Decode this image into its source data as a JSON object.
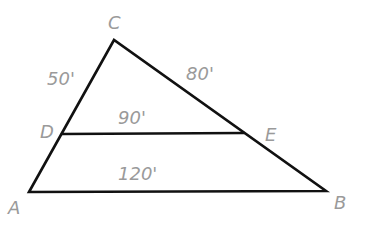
{
  "diagram": {
    "type": "triangle-with-parallel-segment",
    "points": {
      "A": {
        "label": "A",
        "x": 29,
        "y": 192
      },
      "B": {
        "label": "B",
        "x": 326,
        "y": 191
      },
      "C": {
        "label": "C",
        "x": 114,
        "y": 40
      },
      "D": {
        "label": "D",
        "x": 62,
        "y": 134
      },
      "E": {
        "label": "E",
        "x": 244,
        "y": 133
      }
    },
    "segments": [
      {
        "from": "A",
        "to": "C"
      },
      {
        "from": "C",
        "to": "B"
      },
      {
        "from": "A",
        "to": "B"
      },
      {
        "from": "D",
        "to": "E"
      }
    ],
    "measurements": {
      "CD": "50'",
      "CE": "80'",
      "DE": "90'",
      "AB": "120'"
    },
    "colors": {
      "line": "#111111",
      "label": "#9a9a9a"
    }
  }
}
